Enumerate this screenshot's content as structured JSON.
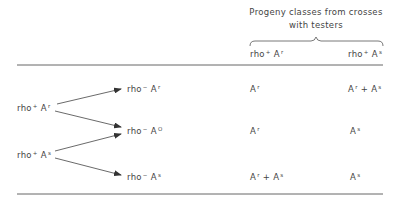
{
  "header": {
    "title_line1": "Progeny classes from crosses",
    "title_line2": "with testers"
  },
  "columns": [
    {
      "base": "rho",
      "sign": "+",
      "allele": "A",
      "sup": "r"
    },
    {
      "base": "rho",
      "sign": "+",
      "allele": "A",
      "sup": "s"
    }
  ],
  "parents": [
    {
      "base": "rho",
      "sign": "+",
      "allele": "A",
      "sup": "r"
    },
    {
      "base": "rho",
      "sign": "+",
      "allele": "A",
      "sup": "s"
    }
  ],
  "rows": [
    {
      "strain": {
        "base": "rho",
        "sign": "−",
        "allele": "A",
        "sup": "r"
      },
      "col1": {
        "text": "A",
        "sup": "r",
        "plus": "",
        "text2": "",
        "sup2": ""
      },
      "col2": {
        "text": "A",
        "sup": "r",
        "plus": "+",
        "text2": "A",
        "sup2": "s"
      }
    },
    {
      "strain": {
        "base": "rho",
        "sign": "−",
        "allele": "A",
        "sup": "O"
      },
      "col1": {
        "text": "A",
        "sup": "r",
        "plus": "",
        "text2": "",
        "sup2": ""
      },
      "col2": {
        "text": "A",
        "sup": "s",
        "plus": "",
        "text2": "",
        "sup2": ""
      }
    },
    {
      "strain": {
        "base": "rho",
        "sign": "−",
        "allele": "A",
        "sup": "s"
      },
      "col1": {
        "text": "A",
        "sup": "r",
        "plus": "+",
        "text2": "A",
        "sup2": "s"
      },
      "col2": {
        "text": "A",
        "sup": "s",
        "plus": "",
        "text2": "",
        "sup2": ""
      }
    }
  ],
  "arrows": [
    {
      "from": "parent-0",
      "to": "row-0"
    },
    {
      "from": "parent-0",
      "to": "row-1"
    },
    {
      "from": "parent-1",
      "to": "row-1"
    },
    {
      "from": "parent-1",
      "to": "row-2"
    }
  ]
}
